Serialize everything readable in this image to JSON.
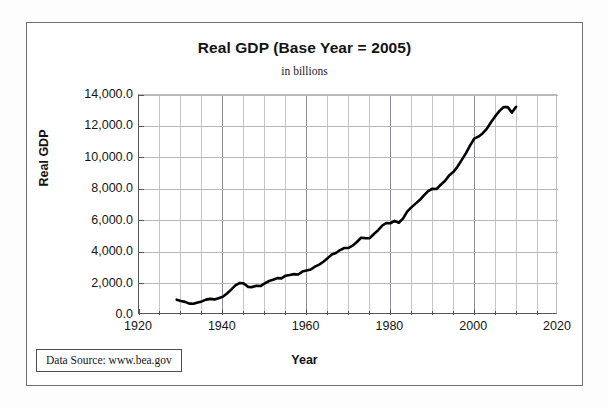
{
  "figure": {
    "title": "Real GDP (Base Year = 2005)",
    "subtitle": "in billions",
    "source_note": "Data Source:  www.bea.gov"
  },
  "chart_data": {
    "type": "line",
    "title": "Real GDP (Base Year = 2005)",
    "subtitle": "in billions",
    "xlabel": "Year",
    "ylabel": "Real GDP",
    "xlim": [
      1920,
      2020
    ],
    "ylim": [
      0.0,
      14000.0
    ],
    "xticks": [
      1920,
      1940,
      1960,
      1980,
      2000,
      2020
    ],
    "xtick_labels": [
      "1920",
      "1940",
      "1960",
      "1980",
      "2000",
      "2020"
    ],
    "yticks": [
      0.0,
      2000.0,
      4000.0,
      6000.0,
      8000.0,
      10000.0,
      12000.0,
      14000.0
    ],
    "ytick_labels": [
      "0.0",
      "2,000.0",
      "4,000.0",
      "6,000.0",
      "8,000.0",
      "10,000.0",
      "12,000.0",
      "14,000.0"
    ],
    "x_minor_tick_step": 5,
    "grid": true,
    "grid_axis": "both",
    "legend": false,
    "units": "billions of chained 2005 dollars",
    "line_color": "#000000",
    "line_width": 2.6,
    "series": [
      {
        "name": "Real GDP",
        "x": [
          1929,
          1930,
          1931,
          1932,
          1933,
          1934,
          1935,
          1936,
          1937,
          1938,
          1939,
          1940,
          1941,
          1942,
          1943,
          1944,
          1945,
          1946,
          1947,
          1948,
          1949,
          1950,
          1951,
          1952,
          1953,
          1954,
          1955,
          1956,
          1957,
          1958,
          1959,
          1960,
          1961,
          1962,
          1963,
          1964,
          1965,
          1966,
          1967,
          1968,
          1969,
          1970,
          1971,
          1972,
          1973,
          1974,
          1975,
          1976,
          1977,
          1978,
          1979,
          1980,
          1981,
          1982,
          1983,
          1984,
          1985,
          1986,
          1987,
          1988,
          1989,
          1990,
          1991,
          1992,
          1993,
          1994,
          1995,
          1996,
          1997,
          1998,
          1999,
          2000,
          2001,
          2002,
          2003,
          2004,
          2005,
          2006,
          2007,
          2008,
          2009,
          2010
        ],
        "values": [
          977,
          892,
          834,
          725,
          716,
          794,
          865,
          978,
          1028,
          992,
          1072,
          1166,
          1366,
          1618,
          1883,
          2035,
          2012,
          1792,
          1776,
          1854,
          1844,
          2006,
          2161,
          2244,
          2347,
          2332,
          2500,
          2549,
          2601,
          2577,
          2762,
          2830,
          2897,
          3074,
          3202,
          3389,
          3609,
          3845,
          3942,
          4133,
          4262,
          4270,
          4414,
          4647,
          4917,
          4890,
          4880,
          5142,
          5377,
          5678,
          5855,
          5839,
          5987,
          5871,
          6136,
          6577,
          6849,
          7087,
          7313,
          7614,
          7886,
          8034,
          8015,
          8287,
          8523,
          8871,
          9094,
          9434,
          9854,
          10284,
          10780,
          11226,
          11347,
          11553,
          11841,
          12264,
          12638,
          12976,
          13229,
          13229,
          12880,
          13248
        ],
        "notes": [
          "Great Depression trough at 1933 (~716)",
          "World War II peak at 1944 (~2,035)",
          "Post-war dip through 1947 (~1,776)",
          "Recession plateau 1974-1975 and 1980-1982",
          "Peak 2007 (~13,229), decline to 2009 (~12,880), rebound 2010 (~13,248)"
        ]
      }
    ]
  },
  "axes": {
    "y_labels": [
      "14,000.0",
      "12,000.0",
      "10,000.0",
      "8,000.0",
      "6,000.0",
      "4,000.0",
      "2,000.0",
      "0.0"
    ],
    "x_labels": [
      "1920",
      "1940",
      "1960",
      "1980",
      "2000",
      "2020"
    ],
    "x_title": "Year",
    "y_title": "Real GDP"
  }
}
